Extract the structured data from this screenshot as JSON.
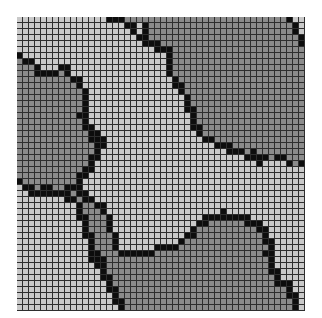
{
  "grid": {
    "cols": 48,
    "rows": 49,
    "cell_px": 6,
    "colors": {
      "L": "#c9c9c9",
      "D": "#8b8b8b",
      "B": "#0d0d0d",
      "line": "#2e2e2e"
    },
    "legend": {
      "L": "light cell",
      "D": "dark gray cell",
      "B": "black boundary cell"
    },
    "data": [
      "LLLLLLLLLLLLLLLBBBDDDDDDDDDDDDDDDDDDDDDDDDDDDBLL",
      "LLLLLLLLLLLLLLLLLLBBLBDDDDDDDDDDDDDDDDDDDDDDDDBL",
      "LLLLLLLLLLLLLLLLLLLBLBDDDDDDDDDDDDDDDDDDDDDDDDBL",
      "LLLLLLLLLLLLLLLLLLLLBBDDDDDDDDDDDDDDDDDDDDDDDDDB",
      "LLLLLLLLLLLLLLLLLLLLLBBBDDDDDDDDDDDDDDDDDDDDDDDB",
      "LLLLLLLLLLLLLLLLLLLLLLLBBBDDDDDDDDDDDDDDDDDDDDDD",
      "BLLLLLLLLLLLLLLLLLLLLLLLLBDDDDDDDDDDDDDDDDDDDDDD",
      "DBBLLLLLLLLLLLLLLLLLLLLLLBDDDDDDDDDDDDDDDDDDDDDD",
      "DDDBLLLBBLLLLLLLLLLLLLLLLBDDDDDDDDDDDDDDDDDDDDDD",
      "DDDBBBBDBLLLLLLLLLLLLLLLLBDDDDDDDDDDDDDDDDDDDDDD",
      "DDDDDDDDDBBLLLLLLLLLLLLLLLBDDDDDDDDDDDDDDDDDDDDD",
      "DDDDDDDDDDBLLLLLLLLLLLLLLLBBDDDDDDDDDDDDDDDDDDDD",
      "DDDDDDDDDDDBLLLLLLLLLLLLLLLBDDDDDDDDDDDDDDDDDDDD",
      "DDDDDDDDDDDBLLLLLLLLLLLLLLLLBDDDDDDDDDDDDDDDDDDD",
      "DDDDDDDDDDDBLLLLLLLLLLLLLLLLBDDDDDDDDDDDDDDDDDDD",
      "DDDDDDDDDDDBLLLLLLLLLLLLLLLLBBDDDDDDDDDDDDDDDDDD",
      "DDDDDDDDDDBBLLLLLLLLLLLLLLLLLBDDDDDDDDDDDDDDDDDD",
      "DDDDDDDDDDDBLLLLLLLLLLLLLLLLLBDDDDDDDDDDDDDDDDDD",
      "DDDDDDDDDDDBBLLLLLLLLLLLLLLLLBBDDDDDDDDDDDDDDDDD",
      "DDDDDDDDDDDDBBLLLLLLLLLLLLLLLLBDDDDDDDDDDDDDDDDD",
      "DDDDDDDDDDDDBBBLLLLLLLLLLLLLLLLBBDDDDDDDDDDDDDDD",
      "DDDDDDDDDDDDDBBLLLLLLLLLLLLLLLLLLBBBDDDDDDDDDDDD",
      "DDDDDDDDDDDDDBLLLLLLLLLLLLLLLLLLLLLBBBDBDDDDDDDD",
      "DDDDDDDDDDDDBBLLLLLLLLLLLLLLLLLLLLLLLLBBBBDBBDDD",
      "DDDDDDDDDDDDBLLLLLLLLLLLLLLLLLLLLLLLLLLLBLLLLBDB",
      "DDDDDDDDDDDBBLLLLLLLLLLLLLLLLLLLLLLLLLLLLLLLLLLL",
      "DDDDDDDDDDBBLLLLLLLLLLLLLLLLLLLLLLLLLLLLLLLLLLLL",
      "BDDDDDDDDDBLLLLLLLLLLLLLLLLLLLLLLLLLLLLLLLLLLLLL",
      "LBBDBBDDBBBLLLLLLLLLLLLLLLLLLLLLLLLLLLLLLLLLLLLL",
      "LLBBBBBBBDBBLLLLLLLLLLLLLLLLLLLLLLLLLLLLLLLLLLLL",
      "LLLLLLLLBBDBBLLLLLLLLLLLLLLLLLLLLLLLLLLLLLLLLLLL",
      "LLLLLLLLLLBDDBBLLLLLLLLLLLLLLLLLLLLLLLLLLLLLLLLL",
      "LLLLLLLLLLBDDDBLLLLLLLLLLLLLLLLLLLBLLLLLLLLLLLLL",
      "LLLLLLLLLLBBDDDBLLLLLLLLLLLLLLLBBBBBBBBLLLLLLLLL",
      "LLLLLLLLLLLBDDDBLLLLLLLLLLLLLLBBDDDDDDBBBLLLLLLL",
      "LLLLLLLLLLLBDDDBLLLLLLLLLLLLLBDDDDDDDDDDBBLLLLLL",
      "LLLLLLLLLLLBBDDDBLLLLLLLLLLLBBDDDDDDDDDDDBLLLLLL",
      "LLLLLLLLLLLLBDDDBLLLLLLLLLLBDDDDDDDDDDDDDBBLLLLL",
      "LLLLLLLLLLLLBDDDBLLLLLLBBBBDDDDDDDDDDDDDDDBLLLLL",
      "LLLLLLLLLLLLBBDDDBBBBBBDDDDDDDDDDDDDDDDDDBBLLLLL",
      "LLLLLLLLLLLLBBBDDDDDDDDDDDDDDDDDDDDDDDDDDDBLLLLL",
      "LLLLLLLLLLLLLBBDDDDDDDDDDDDDDDDDDDDDDDDDDDBLLLLL",
      "LLLLLLLLLLLLLLBDDDDDDDDDDDDDDDDDDDDDDDDDDDBBLLLL",
      "LLLLLLLLLLLLLLBBDDDDDDDDDDDDDDDDDDDDDDDDDDDBLLLL",
      "LLLLLLLLLLLLLLLBDDDDDDDDDDDDDDDDDDDDDDDDDDDBBBLL",
      "LLLLLLLLLLLLLLLBBDDDDDDDDDDDDDDDDDDDDDDDDDDDDBLL",
      "LLLLLLLLLLLLLLLLBDDDDDDDDDDDDDDDDDDDDDDDDDDDDBBL",
      "LLLLLLLLLLLLLLLLBBDDDDDDDDDDDDDDDDDDDDDDDDDDDDBL",
      "LLLLLLLLLLLLLLLLLBDDDDDDDDDDDDDDDDDDDDDDDDDDDDBL"
    ]
  }
}
